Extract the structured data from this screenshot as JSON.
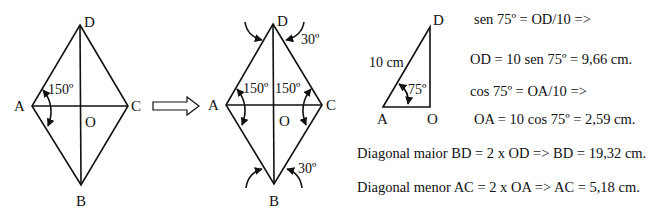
{
  "figure1": {
    "vertices": {
      "D": "D",
      "A": "A",
      "C": "C",
      "B": "B",
      "O": "O"
    },
    "angle_A": "150º"
  },
  "arrow": {
    "icon": "right-arrow-icon"
  },
  "figure2": {
    "vertices": {
      "D": "D",
      "A": "A",
      "C": "C",
      "B": "B",
      "O": "O"
    },
    "angle_A": "150º",
    "angle_C": "150º",
    "angle_D": "30º",
    "angle_B": "30º"
  },
  "triangle": {
    "vertices": {
      "D": "D",
      "A": "A",
      "O": "O"
    },
    "hypotenuse": "10 cm",
    "angle_A": "75º"
  },
  "equations": [
    "sen 75º = OD/10 =>",
    "OD = 10 sen 75º = 9,66 cm.",
    "cos 75º = OA/10 =>",
    "OA = 10 cos 75º = 2,59 cm.",
    "Diagonal maior BD = 2 x OD => BD = 19,32 cm.",
    "Diagonal menor AC = 2 x OA => AC = 5,18 cm."
  ]
}
